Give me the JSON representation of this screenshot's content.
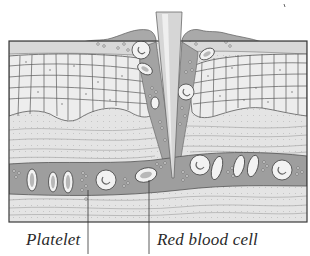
{
  "figure": {
    "type": "cross-section illustration",
    "colors": {
      "background": "#ffffff",
      "frame_border": "#3a3a3a",
      "epidermis_cells_fill": "#ececec",
      "epidermis_cells_stroke": "#555555",
      "dermis_fill": "#e2e2e2",
      "dermis_lines": "#a8a8a8",
      "blood_fill": "#9c9c9c",
      "clot_fill": "#a6a6a6",
      "needle_fill": "#d4d4d4",
      "cell_fill": "#f4f4f4",
      "label_text": "#2a2a2a",
      "leader_line": "#333333"
    },
    "elements": {
      "needle": "needle-icon",
      "red_blood_cells": "red-blood-cell-icon",
      "platelets": "platelet-icon",
      "blood_vessel": "blood-vessel",
      "epidermis": "epidermis-layer",
      "dermis": "dermis-layer"
    }
  },
  "labels": {
    "platelet": "Platelet",
    "red_blood_cell": "Red blood cell"
  }
}
